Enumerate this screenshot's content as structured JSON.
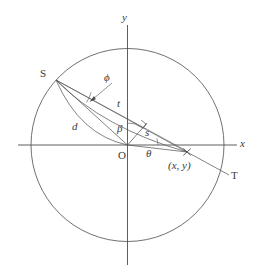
{
  "figure": {
    "kind": "geometry-diagram",
    "stroke_color": "#4d4d4d",
    "label_color": "#3a3a3a",
    "background": "#ffffff"
  },
  "axes": {
    "x_label": "x",
    "y_label": "y",
    "origin_label": "O"
  },
  "points": {
    "source_label": "S",
    "tangent_label": "T",
    "field_point_label": "(x, y)"
  },
  "segments": {
    "distance_d": "d",
    "distance_t": "t",
    "distance_s": "s"
  },
  "angles": {
    "phi": "ϕ",
    "beta": "β",
    "theta": "θ"
  },
  "geometry": {
    "circle_center_x": 127.5,
    "circle_center_y": 145,
    "circle_radius": 96.5,
    "source_x": 56,
    "source_y": 80,
    "field_x": 187,
    "field_y": 152
  }
}
